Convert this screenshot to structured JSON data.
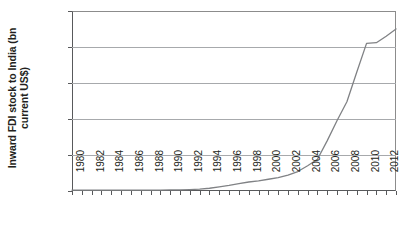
{
  "chart_data": {
    "type": "line",
    "title": "",
    "xlabel": "",
    "ylabel": "Inward FDI stock to India (bn current US$)",
    "ylabel_lines": [
      "Inward FDI stock to India (bn current",
      "US$)"
    ],
    "ylim": [
      0,
      250
    ],
    "xlim": [
      1980,
      2013
    ],
    "yticks": [
      0,
      50,
      100,
      150,
      200,
      250
    ],
    "grid": "horizontal",
    "legend": "none",
    "line_color": "#808285",
    "gridline_color": "#a7a9ac",
    "axis_color": "#58595b",
    "x_tick_labels": [
      "1980",
      "1982",
      "1984",
      "1986",
      "1988",
      "1990",
      "1992",
      "1994",
      "1996",
      "1998",
      "2000",
      "2002",
      "2004",
      "2006",
      "2008",
      "2010",
      "2012"
    ],
    "x": [
      1980,
      1981,
      1982,
      1983,
      1984,
      1985,
      1986,
      1987,
      1988,
      1989,
      1990,
      1991,
      1992,
      1993,
      1994,
      1995,
      1996,
      1997,
      1998,
      1999,
      2000,
      2001,
      2002,
      2003,
      2004,
      2005,
      2006,
      2007,
      2008,
      2009,
      2010,
      2011,
      2012,
      2013
    ],
    "values": [
      1.2,
      1.2,
      1.2,
      1.2,
      1.2,
      1.2,
      1.2,
      1.2,
      1.2,
      1.2,
      1.5,
      1.7,
      2.0,
      2.6,
      3.8,
      5.6,
      7.7,
      10.2,
      12.5,
      14.0,
      16.3,
      18.5,
      22.0,
      27.0,
      35.0,
      44.0,
      70.0,
      98.0,
      124.0,
      165.0,
      205.0,
      206.0,
      215.0,
      225.0
    ],
    "series_name": "Inward FDI stock to India"
  }
}
